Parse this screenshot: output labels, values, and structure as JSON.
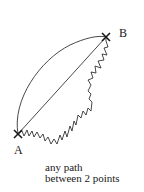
{
  "diagram": {
    "title": "any path between 2 points",
    "points": [
      {
        "id": "A",
        "label": "A",
        "x": 18,
        "y": 134
      },
      {
        "id": "B",
        "label": "B",
        "x": 106,
        "y": 37
      }
    ],
    "paths": [
      {
        "name": "curved-arc",
        "type": "curve",
        "from": "A",
        "to": "B"
      },
      {
        "name": "straight-line",
        "type": "line",
        "from": "A",
        "to": "B"
      },
      {
        "name": "zigzag-path",
        "type": "zigzag",
        "from": "A",
        "to": "B"
      }
    ],
    "caption": {
      "line1": "any path",
      "line2": "between 2 points"
    },
    "colors": {
      "stroke": "#1a1a1a",
      "background": "#ffffff"
    }
  }
}
